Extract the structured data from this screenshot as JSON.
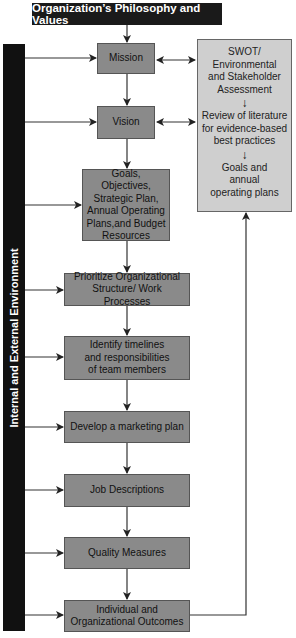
{
  "title": "Organization’s Philosophy and Values",
  "sidebar_label": "Internal and External Environment",
  "flow": [
    {
      "id": "mission",
      "label": "Mission"
    },
    {
      "id": "vision",
      "label": "Vision"
    },
    {
      "id": "goals",
      "label": "Goals, Objectives, Strategic Plan, Annual Operating Plans,and Budget Resources"
    },
    {
      "id": "prioritize",
      "label": "Prioritize Organizational Structure/ Work Processes"
    },
    {
      "id": "identify",
      "label": "Identify timelines and responsibilities of team members"
    },
    {
      "id": "marketing",
      "label": "Develop a marketing plan"
    },
    {
      "id": "jobs",
      "label": "Job Descriptions"
    },
    {
      "id": "quality",
      "label": "Quality Measures"
    },
    {
      "id": "outcomes",
      "label": "Individual and Organizational Outcomes"
    }
  ],
  "side_panel": {
    "items": [
      "SWOT/ Environmental and Stakeholder Assessment",
      "Review of literature for evidence-based best practices",
      "Goals and annual operating plans"
    ],
    "arrow_glyph": "↓"
  },
  "colors": {
    "title_bg": "#1a1a1a",
    "sidebar_bg": "#111111",
    "box_fill": "#8a8a8a",
    "panel_fill": "#cfcfcf",
    "line": "#333333"
  }
}
